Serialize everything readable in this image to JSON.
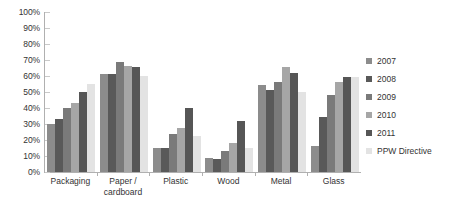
{
  "chart_data": {
    "type": "bar",
    "title": "",
    "subtitle": "",
    "xlabel": "",
    "ylabel": "",
    "ylim": [
      0,
      100
    ],
    "y_tick_labels": [
      "100%",
      "90%",
      "80%",
      "70%",
      "60%",
      "50%",
      "40%",
      "30%",
      "20%",
      "10%",
      "0%"
    ],
    "y_tick_values": [
      100,
      90,
      80,
      70,
      60,
      50,
      40,
      30,
      20,
      10,
      0
    ],
    "grid": true,
    "legend_position": "right",
    "categories": [
      "Packaging",
      "Paper / cardboard",
      "Plastic",
      "Wood",
      "Metal",
      "Glass"
    ],
    "series": [
      {
        "name": "2007",
        "color": "#8c8c8c",
        "values": [
          30,
          61,
          15,
          8.5,
          54.5,
          16.5
        ]
      },
      {
        "name": "2008",
        "color": "#595959",
        "values": [
          33,
          61,
          15,
          8,
          51,
          34.5
        ]
      },
      {
        "name": "2009",
        "color": "#7a7a7a",
        "values": [
          40,
          68.5,
          23.5,
          13,
          56,
          48
        ]
      },
      {
        "name": "2010",
        "color": "#a6a6a6",
        "values": [
          43,
          66.5,
          27.5,
          18,
          65.5,
          56.5
        ]
      },
      {
        "name": "2011",
        "color": "#565656",
        "values": [
          50,
          65.5,
          40,
          32,
          62,
          59.5
        ]
      },
      {
        "name": "PPW Directive",
        "color": "#e3e3e3",
        "values": [
          55,
          60,
          22.5,
          15,
          50,
          59.5
        ]
      }
    ]
  },
  "legend": {
    "items": [
      {
        "label": "2007"
      },
      {
        "label": "2008"
      },
      {
        "label": "2009"
      },
      {
        "label": "2010"
      },
      {
        "label": "2011"
      },
      {
        "label": "PPW Directive"
      }
    ]
  },
  "colors": {
    "axis": "#b0b0b0",
    "gridline": "#c9c9c9",
    "text": "#333333",
    "background": "#ffffff"
  }
}
